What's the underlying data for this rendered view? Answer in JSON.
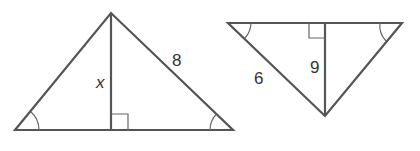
{
  "figures": [
    {
      "id": "left-triangle",
      "orientation": "upright",
      "vertices": {
        "apex": [
          111,
          13
        ],
        "base_left": [
          15,
          130
        ],
        "base_right": [
          233,
          130
        ]
      },
      "altitude": {
        "from": [
          111,
          13
        ],
        "to": [
          111,
          130
        ]
      },
      "right_angle_mark": {
        "x": 111,
        "y": 114,
        "size": 16
      },
      "congruent_angle_marks": [
        "base_left",
        "base_right"
      ],
      "labels": {
        "altitude": "x",
        "right_side": "8"
      }
    },
    {
      "id": "right-triangle",
      "orientation": "inverted",
      "vertices": {
        "top_left": [
          228,
          23
        ],
        "top_right": [
          402,
          23
        ],
        "bottom": [
          325,
          116
        ]
      },
      "altitude": {
        "from": [
          325,
          23
        ],
        "to": [
          325,
          116
        ]
      },
      "right_angle_mark": {
        "x": 309,
        "y": 23,
        "size": 15
      },
      "congruent_angle_marks": [
        "top_left",
        "top_right"
      ],
      "labels": {
        "left_side": "6",
        "altitude": "9"
      }
    }
  ],
  "colors": {
    "stroke": "#555555",
    "text": "#333333",
    "background": "#ffffff"
  }
}
